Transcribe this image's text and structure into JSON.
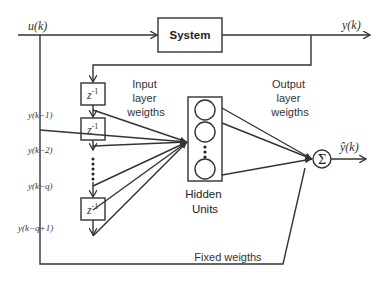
{
  "diagram": {
    "input_label": "u(k)",
    "output_label": "y(k)",
    "estimate_label": "ŷ(k)",
    "system_box": {
      "label": "System"
    },
    "delay_blocks": [
      {
        "label": "z",
        "exponent": "-1",
        "output": "y(k−1)"
      },
      {
        "label": "z",
        "exponent": "-1",
        "output": "y(k−2)"
      },
      {
        "label": "z",
        "exponent": "-1",
        "output": "y(k−q+1)"
      }
    ],
    "intermediate_tap": "y(k−q)",
    "input_weights_label": [
      "Input",
      "layer",
      "weigths"
    ],
    "output_weights_label": [
      "Output",
      "layer",
      "weigths"
    ],
    "hidden_units_label": [
      "Hidden",
      "Units"
    ],
    "summation_symbol": "Σ",
    "fixed_weights_label": "Fixed weigths",
    "colors": {
      "line": "#333333",
      "background": "#ffffff"
    }
  }
}
